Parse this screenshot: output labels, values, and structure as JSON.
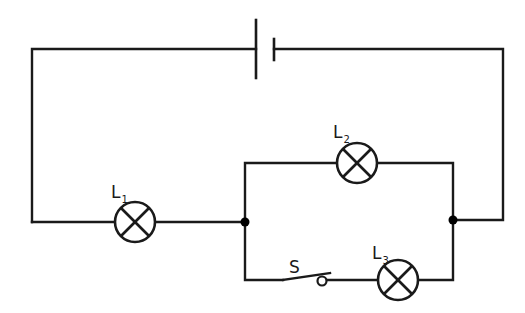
{
  "diagram": {
    "type": "circuit-schematic",
    "components": {
      "battery": {
        "label": ""
      },
      "lamp_1": {
        "label": "L",
        "subscript": "1"
      },
      "lamp_2": {
        "label": "L",
        "subscript": "2"
      },
      "lamp_3": {
        "label": "L",
        "subscript": "3"
      },
      "switch": {
        "label": "S",
        "state": "open"
      }
    },
    "colors": {
      "line": "#1a1a1a",
      "background": "#ffffff",
      "junction": "#000000"
    },
    "junctions": 2
  }
}
